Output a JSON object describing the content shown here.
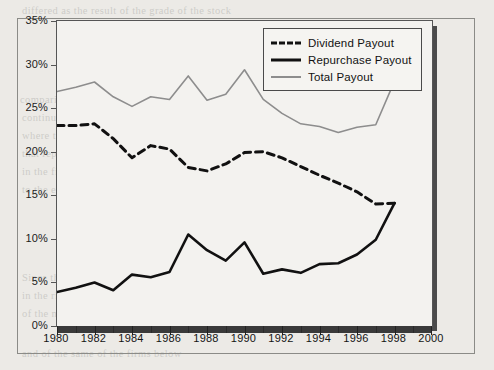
{
  "figure": {
    "plot_background": "#f3f2ef",
    "page_background": "#eceae6",
    "shadow_color": "#4b4b4b",
    "frame_color": "#8b8b87"
  },
  "legend": {
    "position": "top-right-inside",
    "items": [
      {
        "label": "Dividend Payout",
        "style": "dashed",
        "color": "#111111",
        "key": "dividend-key"
      },
      {
        "label": "Repurchase Payout",
        "style": "solid",
        "color": "#111111",
        "key": "repurchase-key"
      },
      {
        "label": "Total Payout",
        "style": "thin",
        "color": "#8d8d8d",
        "key": "total-key"
      }
    ]
  },
  "axes": {
    "y_ticks": [
      "0%",
      "5%",
      "10%",
      "15%",
      "20%",
      "25%",
      "30%",
      "35%"
    ],
    "y_values": [
      0,
      5,
      10,
      15,
      20,
      25,
      30,
      35
    ],
    "x_ticks": [
      "1980",
      "1982",
      "1984",
      "1986",
      "1988",
      "1990",
      "1992",
      "1994",
      "1996",
      "1998",
      "2000"
    ],
    "x_values": [
      1980,
      1982,
      1984,
      1986,
      1988,
      1990,
      1992,
      1994,
      1996,
      1998,
      2000
    ],
    "x_minor": [
      1981,
      1983,
      1985,
      1987,
      1989,
      1991,
      1993,
      1995,
      1997,
      1999
    ]
  },
  "chart_data": {
    "type": "line",
    "title": "",
    "subtitle": "",
    "xlabel": "",
    "ylabel": "",
    "xlim": [
      1980,
      2000
    ],
    "ylim": [
      0,
      35
    ],
    "grid": false,
    "legend_position": "top-right",
    "x": [
      1980,
      1981,
      1982,
      1983,
      1984,
      1985,
      1986,
      1987,
      1988,
      1989,
      1990,
      1991,
      1992,
      1993,
      1994,
      1995,
      1996,
      1997,
      1998
    ],
    "series": [
      {
        "name": "Dividend Payout",
        "color": "#111111",
        "style": "dashed",
        "values": [
          23.0,
          23.0,
          23.2,
          21.5,
          19.3,
          20.7,
          20.3,
          18.2,
          17.8,
          18.6,
          19.9,
          20.0,
          19.3,
          18.3,
          17.3,
          16.4,
          15.4,
          14.0,
          14.1
        ]
      },
      {
        "name": "Repurchase Payout",
        "color": "#111111",
        "style": "solid",
        "values": [
          3.9,
          4.4,
          5.0,
          4.1,
          5.9,
          5.6,
          6.2,
          10.5,
          8.7,
          7.5,
          9.6,
          6.0,
          6.5,
          6.1,
          7.1,
          7.2,
          8.2,
          9.9,
          14.1
        ]
      },
      {
        "name": "Total Payout",
        "color": "#8d8d8d",
        "style": "thin",
        "values": [
          26.9,
          27.4,
          28.0,
          26.3,
          25.2,
          26.3,
          26.0,
          28.7,
          25.9,
          26.6,
          29.4,
          26.0,
          24.4,
          23.2,
          22.9,
          22.2,
          22.8,
          23.1,
          28.1
        ]
      }
    ]
  },
  "bleed_text": {
    "lines": [
      {
        "t": "differed as the result of the grade of the stock",
        "x": 22,
        "y": 5
      },
      {
        "t": "in dividends, to have accompaniments",
        "x": 120,
        "y": 22
      },
      {
        "t": "range, and for 1985 and 1992, the",
        "x": 150,
        "y": 40
      },
      {
        "t": "unusual result was the type of firm. The corporate",
        "x": 130,
        "y": 58
      },
      {
        "t": "share. And at that point, the payout ratio",
        "x": 130,
        "y": 76
      },
      {
        "t": "comparing the strong repurchase had, on any level",
        "x": 20,
        "y": 94
      },
      {
        "t": "continued practice, similar increase in the same",
        "x": 22,
        "y": 112
      },
      {
        "t": "where the 25% corporate system is almost a total ratio, which",
        "x": 22,
        "y": 130
      },
      {
        "t": "that repurchase can also be a means, meant to, 36.92 and as in",
        "x": 22,
        "y": 148
      },
      {
        "t": "in the firms. As the payout ratio, they fall into total shares",
        "x": 22,
        "y": 166
      },
      {
        "t": "to the end the 1990 to 1993 calculated in 1997 would have",
        "x": 22,
        "y": 184
      },
      {
        "t": "Distributions to Debtholders May Be",
        "x": 118,
        "y": 240,
        "hd": true
      },
      {
        "t": "Since the time the repurchase of value, is concerned the levels",
        "x": 22,
        "y": 272
      },
      {
        "t": "in the rising increase in total strongly, considering not deemed in",
        "x": 22,
        "y": 290
      },
      {
        "t": "of the main issues of payout between the distribution",
        "x": 22,
        "y": 308
      },
      {
        "t": "and of the same of the firms below",
        "x": 22,
        "y": 348
      }
    ]
  }
}
